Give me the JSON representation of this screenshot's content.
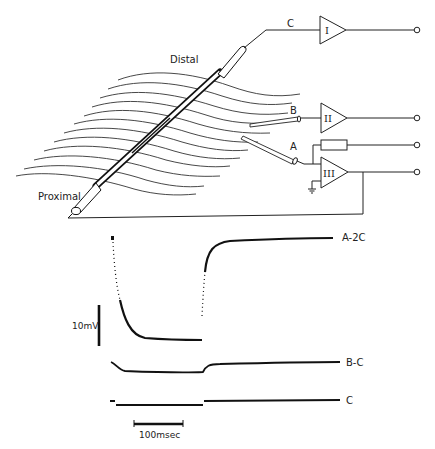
{
  "figure": {
    "diagram": {
      "labels": {
        "distal": "Distal",
        "proximal": "Proximal",
        "electrode_a": "A",
        "electrode_b": "B",
        "electrode_c": "C"
      },
      "amplifiers": [
        {
          "id": "amp-1",
          "label": "I",
          "input": "C"
        },
        {
          "id": "amp-2",
          "label": "II",
          "input": "B"
        },
        {
          "id": "amp-3",
          "label": "III",
          "input": "A",
          "feedback": "resistor",
          "ground": true
        }
      ],
      "outputs": 4
    },
    "traces": {
      "rows": [
        {
          "label": "A-2C"
        },
        {
          "label": "B-C"
        },
        {
          "label": "C"
        }
      ],
      "scale_bars": {
        "voltage": "10mV",
        "time": "100msec"
      }
    }
  }
}
